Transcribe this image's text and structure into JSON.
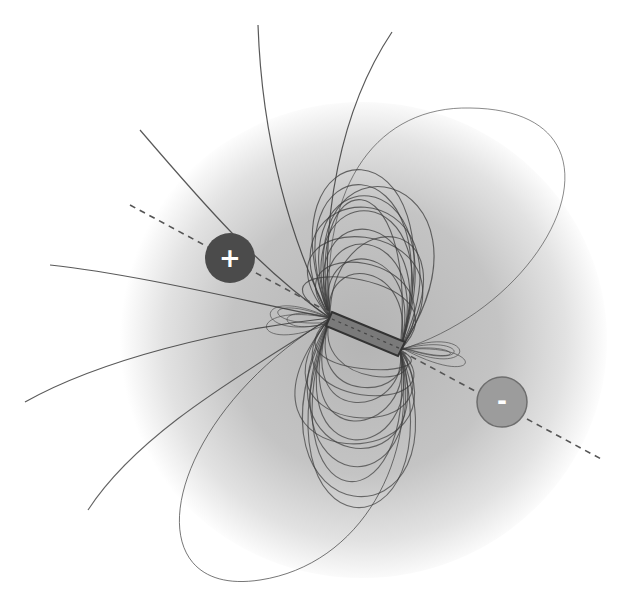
{
  "diagram": {
    "type": "magnetic-dipole-field",
    "poles": [
      {
        "id": "positive",
        "label": "+",
        "fill": "#4b4b4b",
        "cx": 230,
        "cy": 258,
        "r": 25
      },
      {
        "id": "negative",
        "label": "-",
        "fill": "#9c9c9c",
        "stroke": "#6e6e6e",
        "cx": 502,
        "cy": 402,
        "r": 25
      }
    ],
    "axis": {
      "style": "dashed",
      "color": "#5a5a5a",
      "from": [
        130,
        205
      ],
      "to": [
        603,
        460
      ]
    },
    "magnet": {
      "from": [
        330,
        318
      ],
      "to": [
        400,
        350
      ],
      "color": "#555555"
    },
    "halo": {
      "cx": 365,
      "cy": 340,
      "r": 245,
      "inner": "#b8b8b8",
      "outer": "#ffffff"
    },
    "line_color": "#3c3c3c"
  }
}
